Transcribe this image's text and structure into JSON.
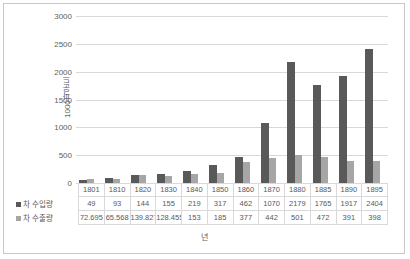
{
  "chart_data": {
    "type": "bar",
    "title": "",
    "xlabel": "년",
    "ylabel": "1000파운드",
    "ylim": [
      0,
      3000
    ],
    "ytick_step": 500,
    "yticks": [
      "3000",
      "2500",
      "2000",
      "1500",
      "1000",
      "500",
      "0"
    ],
    "grid": true,
    "legend_position": "data-table",
    "categories": [
      "1801",
      "1810",
      "1820",
      "1830",
      "1840",
      "1850",
      "1860",
      "1870",
      "1880",
      "1885",
      "1890",
      "1895"
    ],
    "series": [
      {
        "name": "차 수입량",
        "color": "#595959",
        "values": [
          49,
          93,
          144,
          155,
          219,
          317,
          462,
          1070,
          2179,
          1765,
          1917,
          2404
        ],
        "labels": [
          "49",
          "93",
          "144",
          "155",
          "219",
          "317",
          "462",
          "1070",
          "2179",
          "1765",
          "1917",
          "2404"
        ]
      },
      {
        "name": "차 수출량",
        "color": "#a6a6a6",
        "values": [
          72.695,
          65.568,
          139.827,
          128.455,
          153,
          185,
          377,
          442,
          501,
          472,
          391,
          398
        ],
        "labels": [
          "72.695",
          "65.568",
          "139.827",
          "128.455",
          "153",
          "185",
          "377",
          "442",
          "501",
          "472",
          "391",
          "398"
        ]
      }
    ]
  },
  "colors": {
    "import_bar": "#595959",
    "export_bar": "#a6a6a6",
    "gridline": "#d9d9d9",
    "axis_text": "#606060",
    "frame_border": "#c8c8c8"
  }
}
